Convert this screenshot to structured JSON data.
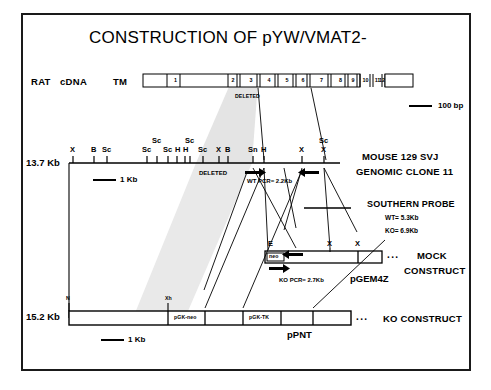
{
  "figure": {
    "title": "CONSTRUCTION OF pYW/VMAT2-",
    "border_color": "#1a1a1a",
    "background_color": "#ffffff",
    "shade_color": "#e3e3e3"
  },
  "cdna_row": {
    "label_rat": "RAT",
    "label_cdna": "cDNA",
    "label_tm": "TM",
    "exons": [
      "1",
      "2",
      "3",
      "4",
      "5",
      "6",
      "7",
      "8",
      "9",
      "10",
      "11",
      "12"
    ],
    "deleted_label": "DELETED",
    "scale": {
      "text": "100 bp"
    }
  },
  "genomic_row": {
    "size_label": "13.7 Kb",
    "name_line1": "MOUSE 129 SVJ",
    "name_line2": "GENOMIC CLONE 11",
    "deleted_label": "DELETED",
    "scale": {
      "text": "1 Kb"
    },
    "pcr_label": "WT PCR= 2.2Kb",
    "sites": [
      {
        "name": "X",
        "x": 73,
        "tier": 0
      },
      {
        "name": "B",
        "x": 94,
        "tier": 0
      },
      {
        "name": "Sc",
        "x": 107,
        "tier": 0
      },
      {
        "name": "Sc",
        "x": 147,
        "tier": 0
      },
      {
        "name": "Sc",
        "x": 157,
        "tier": 1
      },
      {
        "name": "Sc",
        "x": 168,
        "tier": 0
      },
      {
        "name": "H",
        "x": 177,
        "tier": 0
      },
      {
        "name": "H",
        "x": 185,
        "tier": 0
      },
      {
        "name": "Sc",
        "x": 190,
        "tier": 1
      },
      {
        "name": "Sc",
        "x": 203,
        "tier": 0
      },
      {
        "name": "X",
        "x": 219,
        "tier": 0
      },
      {
        "name": "B",
        "x": 228,
        "tier": 0
      },
      {
        "name": "Sn",
        "x": 253,
        "tier": 0
      },
      {
        "name": "H",
        "x": 264,
        "tier": 0
      },
      {
        "name": "X",
        "x": 302,
        "tier": 0
      },
      {
        "name": "Sc",
        "x": 324,
        "tier": 1
      },
      {
        "name": "X",
        "x": 324,
        "tier": 0
      }
    ]
  },
  "southern_probe": {
    "title": "SOUTHERN PROBE",
    "wt": "WT= 5.3Kb",
    "ko": "KO= 6.9Kb"
  },
  "mock_row": {
    "name_line1": "MOCK",
    "name_line2": "CONSTRUCT",
    "plasmid": "pGEM4Z",
    "neo_label": "neo",
    "pcr_label": "KO PCR= 2.7Kb",
    "dots": "...",
    "sites": [
      {
        "name": "E",
        "x": 271
      },
      {
        "name": "X",
        "x": 330
      },
      {
        "name": "X",
        "x": 358
      }
    ]
  },
  "ko_row": {
    "size_label": "15.2 Kb",
    "name": "KO CONSTRUCT",
    "plasmid": "pPNT",
    "pgk_neo_label": "pGK-neo",
    "pgk_tk_label": "pGK-TK",
    "dots": "...",
    "scale": {
      "text": "1 Kb"
    },
    "sites": [
      {
        "name": "N",
        "x": 69
      },
      {
        "name": "Xh",
        "x": 168
      }
    ]
  }
}
